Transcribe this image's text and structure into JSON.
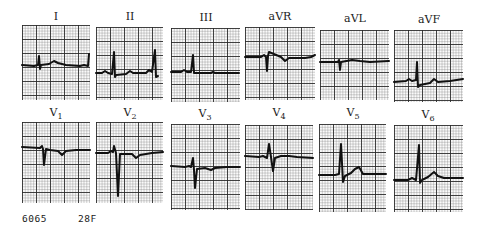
{
  "figure": {
    "caption_id": "6065",
    "caption_patient": "28F"
  },
  "leads": [
    {
      "name": "I",
      "base": "I",
      "sub": ""
    },
    {
      "name": "II",
      "base": "II",
      "sub": ""
    },
    {
      "name": "III",
      "base": "III",
      "sub": ""
    },
    {
      "name": "aVR",
      "base": "aVR",
      "sub": ""
    },
    {
      "name": "aVL",
      "base": "aVL",
      "sub": ""
    },
    {
      "name": "aVF",
      "base": "aVF",
      "sub": ""
    },
    {
      "name": "V1",
      "base": "V",
      "sub": "1"
    },
    {
      "name": "V2",
      "base": "V",
      "sub": "2"
    },
    {
      "name": "V3",
      "base": "V",
      "sub": "3"
    },
    {
      "name": "V4",
      "base": "V",
      "sub": "4"
    },
    {
      "name": "V5",
      "base": "V",
      "sub": "5"
    },
    {
      "name": "V6",
      "base": "V",
      "sub": "6"
    }
  ],
  "colors": {
    "trace": "#111111",
    "grid_major": "#282828",
    "grid_minor": "#787878",
    "paper": "#fafafa"
  }
}
